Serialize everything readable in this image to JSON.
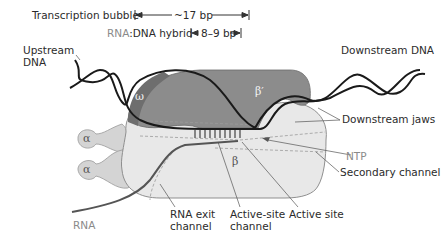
{
  "diagram": {
    "title_labels": {
      "transcription_bubble": "Transcription bubble",
      "bubble_size": "~17 bp",
      "hybrid_rna": "RNA",
      "hybrid_rest": ":DNA hybrid",
      "hybrid_size": "8–9 bp"
    },
    "labels": {
      "upstream_dna_line1": "Upstream",
      "upstream_dna_line2": "DNA",
      "downstream_dna": "Downstream DNA",
      "downstream_jaws": "Downstream jaws",
      "ntp": "NTP",
      "secondary_channel": "Secondary channel",
      "rna_exit_line1": "RNA exit",
      "rna_exit_line2": "channel",
      "active_site_channel_line1": "Active-site",
      "active_site_channel_line2": "channel",
      "active_site": "Active site",
      "rna": "RNA"
    },
    "subunits": {
      "omega": "ω",
      "beta_prime": "β′",
      "beta": "β",
      "alpha1": "α",
      "alpha2": "α"
    },
    "colors": {
      "beta_prime": "#8c8c8c",
      "omega": "#6e6e6e",
      "beta": "#e6e6e6",
      "alpha": "#d4d4d4",
      "dna": "#1a1a1a",
      "rna": "#555555"
    }
  }
}
